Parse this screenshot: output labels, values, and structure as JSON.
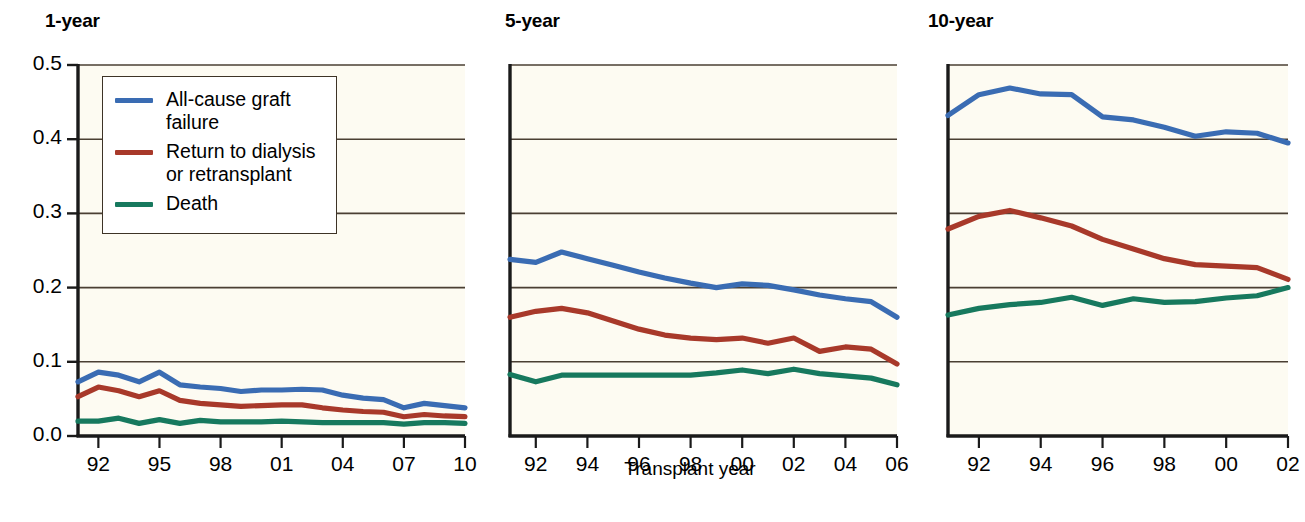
{
  "figure": {
    "y_axis_label": "Probability of outcome",
    "x_axis_label": "Transplant year"
  },
  "colors": {
    "all_cause_graft_failure": "#3a6cb3",
    "return_to_dialysis_or_retransplant": "#a8392a",
    "death": "#17795e",
    "axis": "#1a1a1a",
    "gridline": "#4a3f33",
    "plot_background": "#fdfbf2",
    "legend_border": "#3d3326"
  },
  "legend": {
    "entries": [
      {
        "label": "All-cause graft\nfailure",
        "series": "all_cause_graft_failure"
      },
      {
        "label": "Return to dialysis\nor retransplant",
        "series": "return_to_dialysis_or_retransplant"
      },
      {
        "label": "Death",
        "series": "death"
      }
    ]
  },
  "y_ticks": [
    "0.0",
    "0.1",
    "0.2",
    "0.3",
    "0.4",
    "0.5"
  ],
  "chart_data": [
    {
      "type": "line",
      "title": "1-year",
      "xlabel": "",
      "ylabel": "Probability of outcome",
      "ylim": [
        0.0,
        0.5
      ],
      "xlim": [
        1991,
        2010
      ],
      "grid": true,
      "legend_position": "upper-left",
      "x": [
        1991,
        1992,
        1993,
        1994,
        1995,
        1996,
        1997,
        1998,
        1999,
        2000,
        2001,
        2002,
        2003,
        2004,
        2005,
        2006,
        2007,
        2008,
        2009,
        2010
      ],
      "tick_labels": [
        "92",
        "95",
        "98",
        "01",
        "04",
        "07",
        "10"
      ],
      "tick_values": [
        1992,
        1995,
        1998,
        2001,
        2004,
        2007,
        2010
      ],
      "series": [
        {
          "name": "All-cause graft failure",
          "color": "#3a6cb3",
          "values": [
            0.073,
            0.086,
            0.082,
            0.073,
            0.086,
            0.069,
            0.066,
            0.064,
            0.06,
            0.062,
            0.062,
            0.063,
            0.062,
            0.055,
            0.051,
            0.049,
            0.038,
            0.044,
            0.041,
            0.038
          ]
        },
        {
          "name": "Return to dialysis or retransplant",
          "color": "#a8392a",
          "values": [
            0.053,
            0.066,
            0.061,
            0.053,
            0.061,
            0.048,
            0.044,
            0.042,
            0.04,
            0.041,
            0.042,
            0.042,
            0.038,
            0.035,
            0.033,
            0.032,
            0.026,
            0.029,
            0.027,
            0.026
          ]
        },
        {
          "name": "Death",
          "color": "#17795e",
          "values": [
            0.02,
            0.02,
            0.024,
            0.017,
            0.022,
            0.017,
            0.021,
            0.019,
            0.019,
            0.019,
            0.02,
            0.019,
            0.018,
            0.018,
            0.018,
            0.018,
            0.016,
            0.018,
            0.018,
            0.017
          ]
        }
      ]
    },
    {
      "type": "line",
      "title": "5-year",
      "xlabel": "Transplant year",
      "ylabel": "",
      "ylim": [
        0.0,
        0.5
      ],
      "xlim": [
        1991,
        2006
      ],
      "grid": true,
      "x": [
        1991,
        1992,
        1993,
        1994,
        1995,
        1996,
        1997,
        1998,
        1999,
        2000,
        2001,
        2002,
        2003,
        2004,
        2005,
        2006
      ],
      "tick_labels": [
        "92",
        "94",
        "96",
        "98",
        "00",
        "02",
        "04",
        "06"
      ],
      "tick_values": [
        1992,
        1994,
        1996,
        1998,
        2000,
        2002,
        2004,
        2006
      ],
      "series": [
        {
          "name": "All-cause graft failure",
          "color": "#3a6cb3",
          "values": [
            0.238,
            0.234,
            0.248,
            0.239,
            0.23,
            0.221,
            0.213,
            0.206,
            0.2,
            0.205,
            0.203,
            0.197,
            0.19,
            0.185,
            0.181,
            0.16
          ]
        },
        {
          "name": "Return to dialysis or retransplant",
          "color": "#a8392a",
          "values": [
            0.16,
            0.168,
            0.172,
            0.166,
            0.155,
            0.144,
            0.136,
            0.132,
            0.13,
            0.132,
            0.125,
            0.132,
            0.114,
            0.12,
            0.117,
            0.097
          ]
        },
        {
          "name": "Death",
          "color": "#17795e",
          "values": [
            0.083,
            0.073,
            0.082,
            0.082,
            0.082,
            0.082,
            0.082,
            0.082,
            0.085,
            0.089,
            0.084,
            0.09,
            0.084,
            0.081,
            0.078,
            0.069
          ]
        }
      ]
    },
    {
      "type": "line",
      "title": "10-year",
      "xlabel": "",
      "ylabel": "",
      "ylim": [
        0.0,
        0.5
      ],
      "xlim": [
        1991,
        2002
      ],
      "grid": true,
      "x": [
        1991,
        1992,
        1993,
        1994,
        1995,
        1996,
        1997,
        1998,
        1999,
        2000,
        2001,
        2002
      ],
      "tick_labels": [
        "92",
        "94",
        "96",
        "98",
        "00",
        "02"
      ],
      "tick_values": [
        1992,
        1994,
        1996,
        1998,
        2000,
        2002
      ],
      "series": [
        {
          "name": "All-cause graft failure",
          "color": "#3a6cb3",
          "values": [
            0.432,
            0.46,
            0.469,
            0.461,
            0.46,
            0.43,
            0.426,
            0.416,
            0.404,
            0.41,
            0.408,
            0.395
          ]
        },
        {
          "name": "Return to dialysis or retransplant",
          "color": "#a8392a",
          "values": [
            0.279,
            0.296,
            0.304,
            0.294,
            0.283,
            0.265,
            0.252,
            0.239,
            0.231,
            0.229,
            0.227,
            0.211
          ]
        },
        {
          "name": "Death",
          "color": "#17795e",
          "values": [
            0.163,
            0.172,
            0.177,
            0.18,
            0.187,
            0.176,
            0.185,
            0.18,
            0.181,
            0.186,
            0.189,
            0.2
          ]
        }
      ]
    }
  ]
}
